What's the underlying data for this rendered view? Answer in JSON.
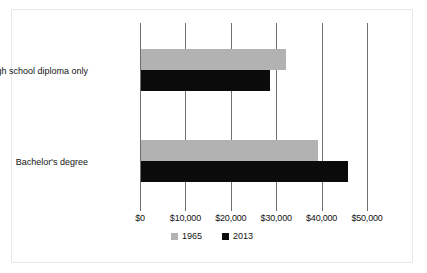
{
  "chart_data": {
    "type": "bar",
    "orientation": "horizontal",
    "title": "",
    "xlabel": "",
    "ylabel": "",
    "categories": [
      "High school diploma only",
      "Bachelor's degree"
    ],
    "series": [
      {
        "name": "1965",
        "color": "#b2b2b2",
        "values": [
          31900,
          39000
        ]
      },
      {
        "name": "2013",
        "color": "#0b0b0b",
        "values": [
          28400,
          45600
        ]
      }
    ],
    "xlim": [
      0,
      50000
    ],
    "xticks": [
      0,
      10000,
      20000,
      30000,
      40000,
      50000
    ],
    "xticklabels": [
      "$0",
      "$10,000",
      "$20,000",
      "$30,000",
      "$40,000",
      "$50,000"
    ],
    "grid": "vertical",
    "legend_position": "bottom-center"
  },
  "legend": {
    "items": [
      {
        "label": "1965"
      },
      {
        "label": "2013"
      }
    ]
  }
}
